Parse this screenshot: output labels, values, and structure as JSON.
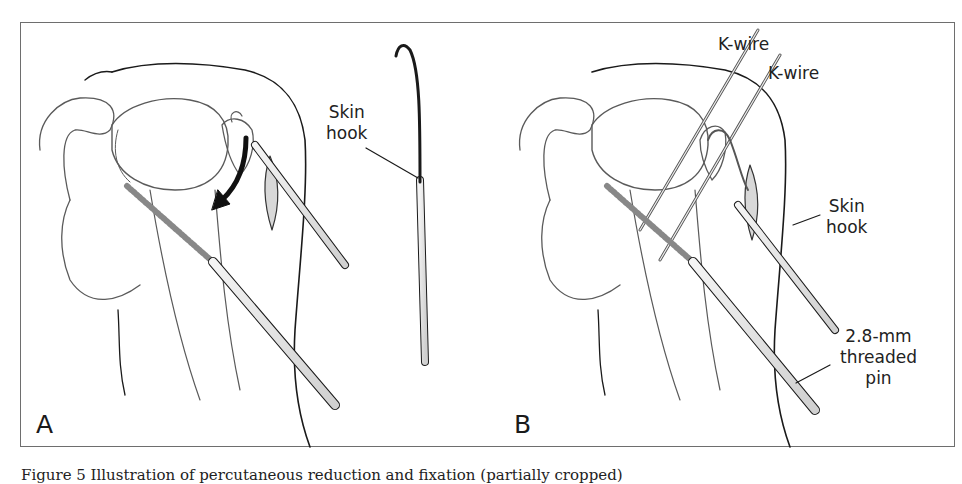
{
  "figure": {
    "panels": [
      {
        "letter": "A",
        "labels": [
          {
            "id": "skin-hook",
            "lines": [
              "Skin",
              "hook"
            ]
          }
        ],
        "annotations": [
          "curved arrow indicating reduction direction"
        ]
      },
      {
        "letter": "B",
        "labels": [
          {
            "id": "k-wire-1",
            "lines": [
              "K-wire"
            ]
          },
          {
            "id": "k-wire-2",
            "lines": [
              "K-wire"
            ]
          },
          {
            "id": "skin-hook",
            "lines": [
              "Skin",
              "hook"
            ]
          },
          {
            "id": "threaded-pin",
            "lines": [
              "2.8-mm",
              "threaded",
              "pin"
            ]
          }
        ]
      }
    ],
    "caption_visible": "Figure 5  Illustration of percutaneous reduction and fixation (partially cropped)"
  },
  "colors": {
    "line": "#1a1a1a",
    "bone_line": "#5a5a5a",
    "frame": "#6e6e6e",
    "instrument_fill": "#e6e6e6"
  }
}
